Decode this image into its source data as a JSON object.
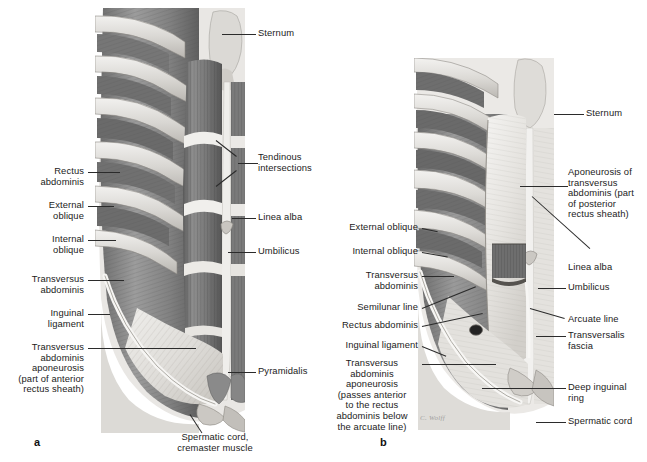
{
  "figure": {
    "domain": "anatomical-illustration",
    "background_color": "#ffffff",
    "ink_color": "#1b1b1b",
    "leader_color": "#2b2b2b",
    "panel_count": 2
  },
  "panels": [
    {
      "id": "a",
      "letter": "a",
      "description": "Superficial dissection of the anterior abdominal wall: rectus abdominis exposed on the right side with tendinous intersections, external oblique reflected on the left, pyramidalis and spermatic cord inferiorly.",
      "labels_left": [
        {
          "id": "rectus-abdominis",
          "text": "Rectus\nabdominis"
        },
        {
          "id": "external-oblique",
          "text": "External\noblique"
        },
        {
          "id": "internal-oblique",
          "text": "Internal\noblique"
        },
        {
          "id": "transversus-abdominis",
          "text": "Transversus\nabdominis"
        },
        {
          "id": "inguinal-ligament",
          "text": "Inguinal\nligament"
        },
        {
          "id": "transversus-aponeurosis",
          "text": "Transversus\nabdominis\naponeurosis\n(part of anterior\nrectus sheath)"
        }
      ],
      "labels_right": [
        {
          "id": "sternum",
          "text": "Sternum"
        },
        {
          "id": "tendinous-intersections",
          "text": "Tendinous\nintersections"
        },
        {
          "id": "linea-alba",
          "text": "Linea alba"
        },
        {
          "id": "umbilicus",
          "text": "Umbilicus"
        },
        {
          "id": "pyramidalis",
          "text": "Pyramidalis"
        }
      ],
      "labels_bottom": [
        {
          "id": "spermatic-cord-cremaster",
          "text": "Spermatic cord,\ncremaster muscle"
        }
      ]
    },
    {
      "id": "b",
      "letter": "b",
      "description": "Deeper dissection: rectus abdominis window removed revealing the arcuate line, transversalis fascia, deep inguinal ring and the posterior rectus sheath formed by the aponeurosis of transversus abdominis.",
      "signature": "C. Wolff",
      "labels_left": [
        {
          "id": "external-oblique",
          "text": "External oblique"
        },
        {
          "id": "internal-oblique",
          "text": "Internal oblique"
        },
        {
          "id": "transversus-abdominis",
          "text": "Transversus\nabdominis"
        },
        {
          "id": "semilunar-line",
          "text": "Semilunar line"
        },
        {
          "id": "rectus-abdominis",
          "text": "Rectus abdominis"
        },
        {
          "id": "inguinal-ligament",
          "text": "Inguinal ligament"
        },
        {
          "id": "transversus-aponeurosis",
          "text": "Transversus\nabdominis\naponeurosis\n(passes anterior\nto the rectus\nabdominis below\nthe arcuate line)"
        }
      ],
      "labels_right": [
        {
          "id": "sternum",
          "text": "Sternum"
        },
        {
          "id": "aponeurosis-posterior",
          "text": "Aponeurosis of\ntransversus\nabdominis (part\nof posterior\nrectus sheath)"
        },
        {
          "id": "linea-alba",
          "text": "Linea alba"
        },
        {
          "id": "umbilicus",
          "text": "Umbilicus"
        },
        {
          "id": "arcuate-line",
          "text": "Arcuate line"
        },
        {
          "id": "transversalis-fascia",
          "text": "Transversalis\nfascia"
        },
        {
          "id": "deep-inguinal-ring",
          "text": "Deep inguinal\nring"
        },
        {
          "id": "spermatic-cord",
          "text": "Spermatic cord"
        }
      ]
    }
  ]
}
